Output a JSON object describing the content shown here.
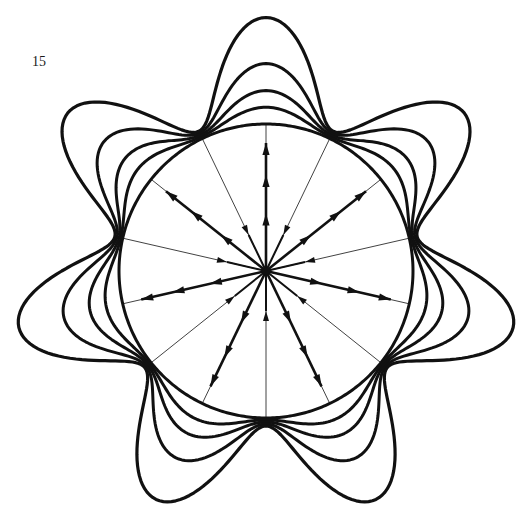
{
  "figure": {
    "number_label": "15",
    "ink_color": "#111111",
    "background_color": "#ffffff",
    "lobe_count": 7,
    "lobe_phase_deg": -90,
    "spokes": {
      "count": 14,
      "arrow_spoke_angles_deg": [
        -90,
        -38.6,
        12.9,
        64.3,
        115.7,
        167.1,
        218.6
      ],
      "thin_spoke_angles_deg": [
        -64.3,
        -12.9,
        38.6,
        90,
        141.4,
        192.9,
        244.3
      ]
    },
    "contours": [
      {
        "name": "reference-circle",
        "relative_amplitude": 0
      },
      {
        "name": "contour-1",
        "relative_amplitude": 0.1
      },
      {
        "name": "contour-2",
        "relative_amplitude": 0.2
      },
      {
        "name": "contour-3",
        "relative_amplitude": 0.37
      },
      {
        "name": "contour-4",
        "relative_amplitude": 0.67
      }
    ]
  }
}
